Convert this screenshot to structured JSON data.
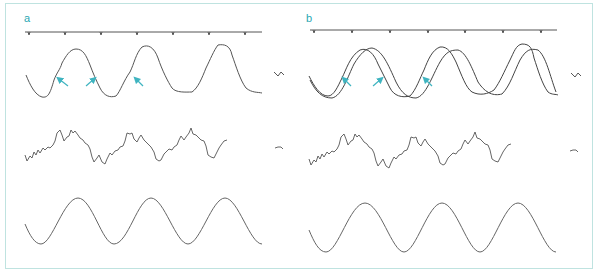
{
  "figure": {
    "panels": [
      {
        "label": "a",
        "traces": [
          {
            "name": "event-marker-timeline",
            "description": "horizontal line with periodic tick markers"
          },
          {
            "name": "recorded-waveform",
            "description": "single irregular periodic waveform, 3 cycles"
          },
          {
            "name": "noisy-signal",
            "description": "high-frequency noisy signal riding on slow oscillation"
          },
          {
            "name": "reference-sinusoid",
            "description": "smooth sine wave, 3 cycles"
          }
        ],
        "arrows": 3
      },
      {
        "label": "b",
        "traces": [
          {
            "name": "event-marker-timeline",
            "description": "horizontal line with periodic tick markers"
          },
          {
            "name": "recorded-waveform-overlay",
            "description": "recorded waveform overlaid with fitted smooth curve"
          },
          {
            "name": "noisy-signal",
            "description": "high-frequency noisy signal riding on slow oscillation"
          },
          {
            "name": "reference-sinusoid",
            "description": "smooth sine wave, 3 cycles"
          }
        ],
        "arrows": 3
      }
    ],
    "colors": {
      "frame": "#bfe3e0",
      "label": "#2aa7b3",
      "arrow": "#3fb4c0",
      "trace": "#555555"
    }
  }
}
